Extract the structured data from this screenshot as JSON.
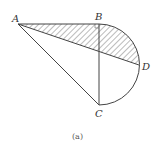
{
  "figure": {
    "caption": "(a)",
    "points": {
      "A": {
        "label": "A",
        "x": 18,
        "y": 24
      },
      "B": {
        "label": "B",
        "x": 99,
        "y": 24
      },
      "C": {
        "label": "C",
        "x": 99,
        "y": 105
      },
      "D": {
        "label": "D",
        "x": 139,
        "y": 65
      }
    },
    "segments": [
      "AB",
      "AC",
      "AD",
      "BC"
    ],
    "arc": {
      "from": "B",
      "through": "D",
      "to": "C",
      "type": "semicircle"
    },
    "shaded_region": "region bounded by AB, arc BD, and DA",
    "colors": {
      "stroke": "#444444",
      "hatch": "#555555",
      "background": "#ffffff"
    }
  }
}
